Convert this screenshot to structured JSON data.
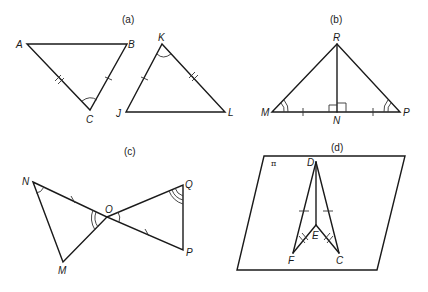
{
  "figure": {
    "panels": [
      {
        "id": "a",
        "caption": "(a)",
        "triangles": [
          {
            "vertices": [
              "A",
              "B",
              "C"
            ],
            "marked_sides": {
              "AC": 2,
              "BC": 1
            },
            "marked_angle": "C"
          },
          {
            "vertices": [
              "J",
              "K",
              "L"
            ],
            "marked_sides": {
              "JK": 1,
              "KL": 2
            },
            "marked_angle": "K"
          }
        ],
        "labels": {
          "A": "A",
          "B": "B",
          "C": "C",
          "J": "J",
          "K": "K",
          "L": "L"
        }
      },
      {
        "id": "b",
        "caption": "(b)",
        "triangle": [
          "M",
          "R",
          "P"
        ],
        "altitude": "RN",
        "right_angle_at": "N",
        "marked_sides": {
          "MN": 1,
          "NP": 1
        },
        "marked_angles": {
          "M": 2,
          "P": 2
        },
        "labels": {
          "R": "R",
          "M": "M",
          "N": "N",
          "P": "P"
        }
      },
      {
        "id": "c",
        "caption": "(c)",
        "triangles": [
          [
            "N",
            "O",
            "M"
          ],
          [
            "O",
            "Q",
            "P"
          ]
        ],
        "marked_sides": {
          "NO": 1,
          "OP": 1
        },
        "marked_angles": {
          "N": 1,
          "O_left": 2,
          "O_right": 1,
          "Q": 3
        },
        "labels": {
          "N": "N",
          "O": "O",
          "Q": "Q",
          "P": "P",
          "M": "M"
        }
      },
      {
        "id": "d",
        "caption": "(d)",
        "plane_label": "π",
        "segments": [
          "DF",
          "DC",
          "DE",
          "EF",
          "EC"
        ],
        "marked_sides": {
          "DF": 1,
          "DC": 1,
          "EF": 2,
          "EC": 2
        },
        "labels": {
          "D": "D",
          "E": "E",
          "F": "F",
          "C": "C"
        }
      }
    ]
  }
}
